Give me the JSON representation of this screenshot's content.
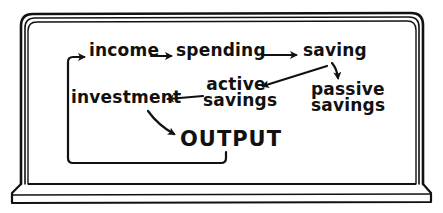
{
  "diagram": {
    "type": "flowchart",
    "style": "hand-drawn on blackboard frame",
    "colors": {
      "ink": "#111111",
      "background": "#ffffff"
    },
    "nodes": {
      "income": "income",
      "spending": "spending",
      "saving": "saving",
      "active_savings": {
        "line1": "active",
        "line2": "savings"
      },
      "passive_savings": {
        "line1": "passive",
        "line2": "savings"
      },
      "investment": "investment",
      "output": "OUTPUT"
    },
    "edges": [
      {
        "from": "income",
        "to": "spending"
      },
      {
        "from": "spending",
        "to": "saving"
      },
      {
        "from": "saving",
        "to": "active savings"
      },
      {
        "from": "saving",
        "to": "passive savings"
      },
      {
        "from": "active savings",
        "to": "investment"
      },
      {
        "from": "investment",
        "to": "OUTPUT"
      },
      {
        "from": "OUTPUT",
        "to": "income"
      }
    ]
  }
}
